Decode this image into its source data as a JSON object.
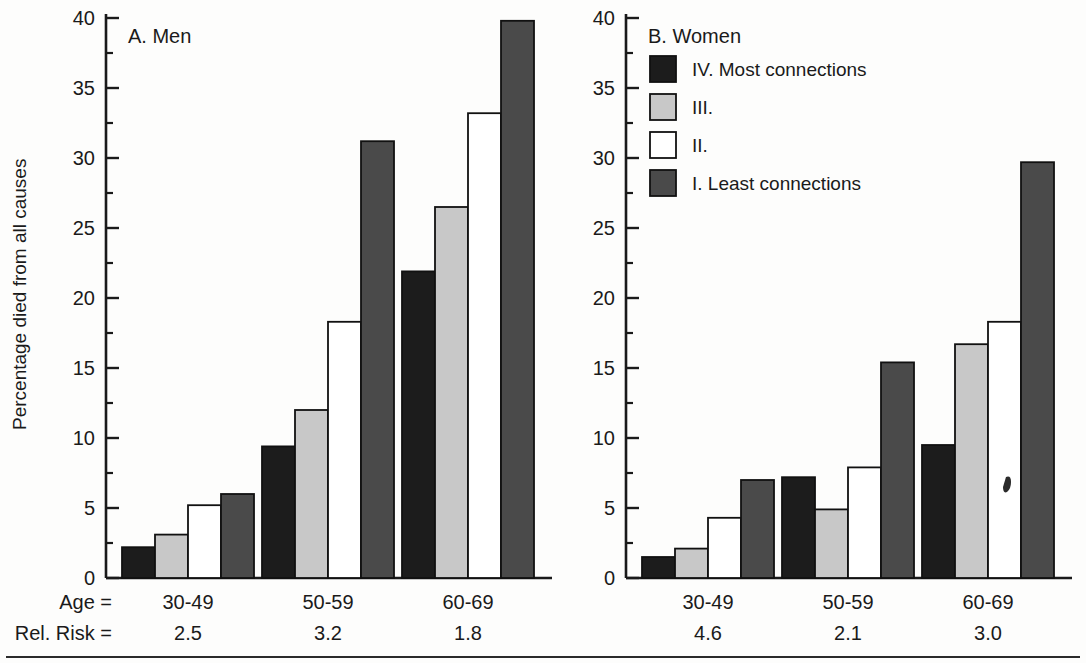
{
  "figure": {
    "ylabel": "Percentage died from all causes",
    "row_labels": {
      "age": "Age  =",
      "risk": "Rel. Risk  ="
    },
    "bottom_rule": true
  },
  "legend": {
    "items": [
      {
        "label": "IV.  Most connections",
        "color": "#1c1c1c"
      },
      {
        "label": "III.",
        "color": "#c8c8c8"
      },
      {
        "label": "II.",
        "color": "#ffffff"
      },
      {
        "label": "I.  Least connections",
        "color": "#4a4a4a"
      }
    ]
  },
  "chart_data": [
    {
      "type": "bar",
      "title": "A.  Men",
      "panel": "A",
      "xlabel": "",
      "ylabel": "Percentage died from all causes",
      "ylim": [
        0,
        40
      ],
      "yticks": [
        0,
        5,
        10,
        15,
        20,
        25,
        30,
        35,
        40
      ],
      "ytick_labels": [
        "0",
        "5",
        "10",
        "15",
        "20",
        "25",
        "30",
        "35",
        "40"
      ],
      "minor_ticks": [
        2.5,
        7.5,
        12.5,
        17.5,
        22.5,
        27.5,
        32.5,
        37.5
      ],
      "grid": false,
      "legend_position": "none",
      "categories": [
        "30-49",
        "50-59",
        "60-69"
      ],
      "rel_risk": [
        "2.5",
        "3.2",
        "1.8"
      ],
      "series": [
        {
          "name": "IV.  Most connections",
          "color": "#1c1c1c",
          "values": [
            2.2,
            9.4,
            21.9
          ]
        },
        {
          "name": "III.",
          "color": "#c8c8c8",
          "values": [
            3.1,
            12.0,
            26.5
          ]
        },
        {
          "name": "II.",
          "color": "#ffffff",
          "values": [
            5.2,
            18.3,
            33.2
          ]
        },
        {
          "name": "I.  Least connections",
          "color": "#4a4a4a",
          "values": [
            6.0,
            31.2,
            39.8
          ]
        }
      ]
    },
    {
      "type": "bar",
      "title": "B.  Women",
      "panel": "B",
      "xlabel": "",
      "ylabel": "",
      "ylim": [
        0,
        40
      ],
      "yticks": [
        0,
        5,
        10,
        15,
        20,
        25,
        30,
        35,
        40
      ],
      "ytick_labels": [
        "0",
        "5",
        "10",
        "15",
        "20",
        "25",
        "30",
        "35",
        "40"
      ],
      "minor_ticks": [
        2.5,
        7.5,
        12.5,
        17.5,
        22.5,
        27.5,
        32.5,
        37.5
      ],
      "grid": false,
      "legend_position": "upper-left",
      "categories": [
        "30-49",
        "50-59",
        "60-69"
      ],
      "rel_risk": [
        "4.6",
        "2.1",
        "3.0"
      ],
      "series": [
        {
          "name": "IV.  Most connections",
          "color": "#1c1c1c",
          "values": [
            1.5,
            7.2,
            9.5
          ]
        },
        {
          "name": "III.",
          "color": "#c8c8c8",
          "values": [
            2.1,
            4.9,
            16.7
          ]
        },
        {
          "name": "II.",
          "color": "#ffffff",
          "values": [
            4.3,
            7.9,
            18.3
          ]
        },
        {
          "name": "I.  Least connections",
          "color": "#4a4a4a",
          "values": [
            7.0,
            15.4,
            29.7
          ]
        }
      ]
    }
  ]
}
